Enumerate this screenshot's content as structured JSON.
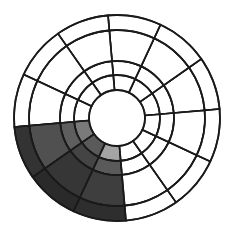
{
  "diagram": {
    "type": "polar-segment-grid",
    "center": [
      117,
      118
    ],
    "ring_radii": [
      28,
      43,
      57,
      88,
      103
    ],
    "sector_count": 12,
    "sector_start_angle_deg": 5,
    "sector_span_deg": 30,
    "default_fill": "#ffffff",
    "line_color": "#1a1a1a",
    "center_hole_fill": "#ffffff",
    "shaded_cells": [
      {
        "band": 0,
        "sector": 6,
        "fill": "#7a7a7a"
      },
      {
        "band": 0,
        "sector": 7,
        "fill": "#5a5a5a"
      },
      {
        "band": 0,
        "sector": 8,
        "fill": "#a4a4a4"
      },
      {
        "band": 1,
        "sector": 6,
        "fill": "#5e5e5e"
      },
      {
        "band": 1,
        "sector": 7,
        "fill": "#444444"
      },
      {
        "band": 1,
        "sector": 8,
        "fill": "#5a5a5a"
      },
      {
        "band": 2,
        "sector": 6,
        "fill": "#505050"
      },
      {
        "band": 2,
        "sector": 7,
        "fill": "#363636"
      },
      {
        "band": 2,
        "sector": 8,
        "fill": "#3e3e3e"
      },
      {
        "band": 3,
        "sector": 6,
        "fill": "#333333"
      },
      {
        "band": 3,
        "sector": 7,
        "fill": "#2a2a2a"
      },
      {
        "band": 3,
        "sector": 8,
        "fill": "#2e2e2e"
      }
    ]
  }
}
